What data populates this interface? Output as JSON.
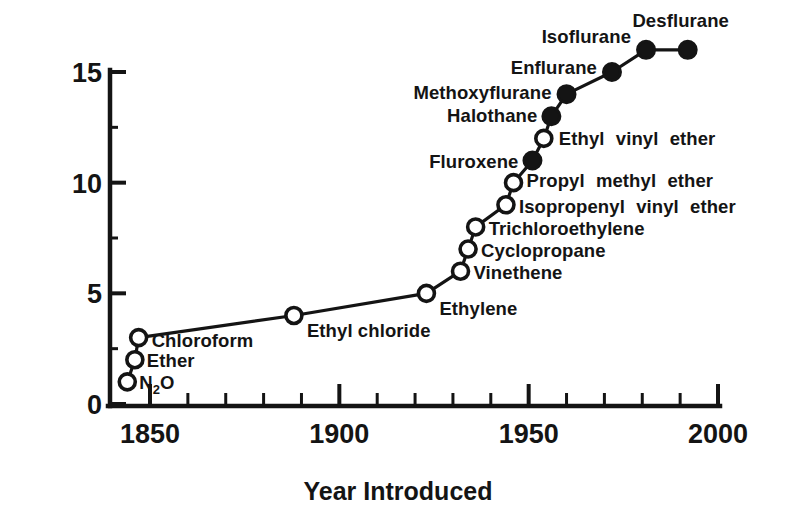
{
  "chart_data": {
    "type": "line",
    "title": "",
    "xlabel": "Year Introduced",
    "ylabel": "",
    "xlim": [
      1844,
      2000
    ],
    "ylim": [
      0,
      16.5
    ],
    "grid": false,
    "legend": "none",
    "x_ticks_major": [
      1850,
      1900,
      1950,
      2000
    ],
    "x_tick_labels": [
      "1850",
      "1900",
      "1950",
      "2000"
    ],
    "x_ticks_minor": [
      1860,
      1870,
      1880,
      1890,
      1910,
      1920,
      1930,
      1940,
      1960,
      1970,
      1980,
      1990
    ],
    "y_ticks_major": [
      0,
      5,
      10,
      15
    ],
    "y_tick_labels": [
      "0",
      "5",
      "10",
      "15"
    ],
    "series": [
      {
        "name": "Cumulative anesthetics introduced",
        "points": [
          {
            "label": "N2O",
            "label_html": "N<tspan class=\"sub\" dy=\"5\">2</tspan><tspan dy=\"-5\">O</tspan>",
            "x": 1844,
            "y": 1,
            "marker": "open",
            "anchor": "right",
            "dx": 12,
            "dy": 7
          },
          {
            "label": "Ether",
            "x": 1846,
            "y": 2,
            "marker": "open",
            "anchor": "right",
            "dx": 12,
            "dy": 7
          },
          {
            "label": "Chloroform",
            "x": 1847,
            "y": 3,
            "marker": "open",
            "anchor": "right",
            "dx": 13,
            "dy": 9
          },
          {
            "label": "Ethyl chloride",
            "x": 1888,
            "y": 4,
            "marker": "open",
            "anchor": "right",
            "dx": 13,
            "dy": 22
          },
          {
            "label": "Ethylene",
            "x": 1923,
            "y": 5,
            "marker": "open",
            "anchor": "right",
            "dx": 13,
            "dy": 22
          },
          {
            "label": "Vinethene",
            "x": 1932,
            "y": 6,
            "marker": "open",
            "anchor": "right",
            "dx": 13,
            "dy": 8
          },
          {
            "label": "Cyclopropane",
            "x": 1934,
            "y": 7,
            "marker": "open",
            "anchor": "right",
            "dx": 13,
            "dy": 8
          },
          {
            "label": "Trichloroethylene",
            "x": 1936,
            "y": 8,
            "marker": "open",
            "anchor": "right",
            "dx": 13,
            "dy": 8
          },
          {
            "label": "Isopropenyl vinyl ether",
            "x": 1944,
            "y": 9,
            "marker": "open",
            "anchor": "right",
            "dx": 13,
            "dy": 8
          },
          {
            "label": "Propyl methyl ether",
            "x": 1946,
            "y": 10,
            "marker": "open",
            "anchor": "right",
            "dx": 13,
            "dy": 4
          },
          {
            "label": "Fluroxene",
            "x": 1951,
            "y": 11,
            "marker": "filled",
            "anchor": "left",
            "dx": -14,
            "dy": 7
          },
          {
            "label": "Ethyl vinyl ether",
            "x": 1954,
            "y": 12,
            "marker": "open",
            "anchor": "right",
            "dx": 15,
            "dy": 7
          },
          {
            "label": "Halothane",
            "x": 1956,
            "y": 13,
            "marker": "filled",
            "anchor": "left",
            "dx": -14,
            "dy": 6
          },
          {
            "label": "Methoxyflurane",
            "x": 1960,
            "y": 14,
            "marker": "filled",
            "anchor": "left",
            "dx": -15,
            "dy": 5
          },
          {
            "label": "Enflurane",
            "x": 1972,
            "y": 15,
            "marker": "filled",
            "anchor": "left",
            "dx": -15,
            "dy": 2
          },
          {
            "label": "Isoflurane",
            "x": 1981,
            "y": 16,
            "marker": "filled",
            "anchor": "left",
            "dx": -15,
            "dy": -7
          },
          {
            "label": "Desflurane",
            "x": 1992,
            "y": 16,
            "marker": "filled",
            "anchor": "mid",
            "dx": -7,
            "dy": -23
          }
        ]
      }
    ]
  }
}
